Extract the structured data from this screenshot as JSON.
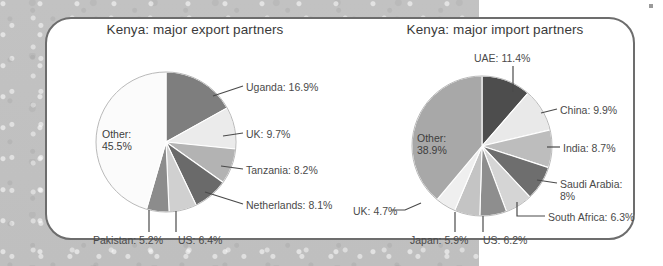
{
  "figure": {
    "background_color": "#c0c0c0",
    "panel_color": "#ffffff",
    "panel_border_color": "#6d6d6d"
  },
  "chart_data": [
    {
      "type": "pie",
      "id": "export",
      "title": "Kenya: major export partners",
      "unit": "percent",
      "start_angle_deg": 0,
      "direction": "clockwise",
      "categories": [
        "Uganda",
        "UK",
        "Tanzania",
        "Netherlands",
        "US",
        "Pakistan",
        "Other"
      ],
      "values": [
        16.9,
        9.7,
        8.2,
        8.1,
        6.4,
        5.2,
        45.5
      ],
      "colors": [
        "#7e7e7e",
        "#ebebeb",
        "#b3b3b3",
        "#6a6a6a",
        "#d0d0d0",
        "#8c8c8c",
        "#fbfbfb"
      ],
      "labels": [
        "Uganda: 16.9%",
        "UK: 9.7%",
        "Tanzania: 8.2%",
        "Netherlands: 8.1%",
        "US: 6.4%",
        "Pakistan: 5.2%",
        "Other:\n45.5%"
      ],
      "inner_label": "Other:\n45.5%",
      "legend": "none",
      "grid": false
    },
    {
      "type": "pie",
      "id": "import",
      "title": "Kenya: major import partners",
      "unit": "percent",
      "start_angle_deg": 0,
      "direction": "clockwise",
      "categories": [
        "UAE",
        "China",
        "India",
        "Saudi Arabia",
        "South Africa",
        "US",
        "Japan",
        "UK",
        "Other"
      ],
      "values": [
        11.4,
        9.9,
        8.7,
        8.0,
        6.3,
        6.2,
        5.9,
        4.7,
        38.9
      ],
      "colors": [
        "#4d4d4d",
        "#e9e9e9",
        "#bdbdbd",
        "#6e6e6e",
        "#d5d5d5",
        "#8e8e8e",
        "#c4c4c4",
        "#efefef",
        "#a8a8a8"
      ],
      "labels": [
        "UAE: 11.4%",
        "China: 9.9%",
        "India: 8.7%",
        "Saudi Arabia:\n8%",
        "South Africa: 6.3%",
        "US: 6.2%",
        "Japan: 5.9%",
        "UK: 4.7%",
        "Other:\n38.9%"
      ],
      "inner_label": "Other:\n38.9%",
      "legend": "none",
      "grid": false
    }
  ],
  "export_chart": {
    "title": "Kenya: major export partners",
    "inner_label": "Other:\n45.5%",
    "callouts": [
      {
        "name": "uganda",
        "text": "Uganda: 16.9%"
      },
      {
        "name": "uk",
        "text": "UK: 9.7%"
      },
      {
        "name": "tanzania",
        "text": "Tanzania: 8.2%"
      },
      {
        "name": "netherlands",
        "text": "Netherlands: 8.1%"
      },
      {
        "name": "us",
        "text": "US: 6.4%"
      },
      {
        "name": "pakistan",
        "text": "Pakistan: 5.2%"
      }
    ]
  },
  "import_chart": {
    "title": "Kenya: major import partners",
    "inner_label": "Other:\n38.9%",
    "callouts": [
      {
        "name": "uae",
        "text": "UAE: 11.4%"
      },
      {
        "name": "china",
        "text": "China: 9.9%"
      },
      {
        "name": "india",
        "text": "India: 8.7%"
      },
      {
        "name": "saudi-arabia",
        "text": "Saudi Arabia:\n8%"
      },
      {
        "name": "south-africa",
        "text": "South Africa: 6.3%"
      },
      {
        "name": "us",
        "text": "US: 6.2%"
      },
      {
        "name": "japan",
        "text": "Japan: 5.9%"
      },
      {
        "name": "uk",
        "text": "UK: 4.7%"
      }
    ]
  }
}
